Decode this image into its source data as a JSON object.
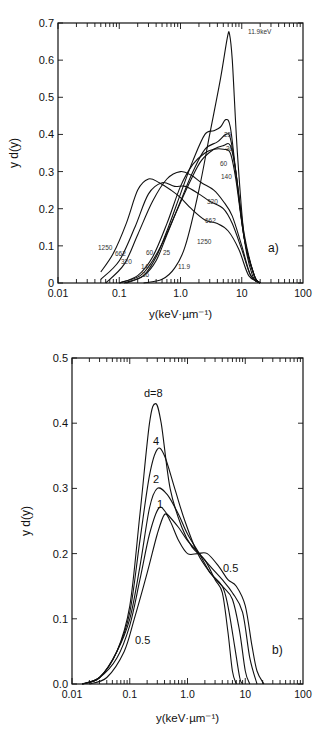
{
  "chart_data": [
    {
      "panel": "a)",
      "type": "line",
      "title": "",
      "xlabel": "y(keV·µm⁻¹)",
      "ylabel": "y d(y)",
      "xscale": "log",
      "xlim": [
        0.01,
        100
      ],
      "ylim": [
        0,
        0.7
      ],
      "xticks": [
        "0.01",
        "0.1",
        "1.0",
        "10",
        "100"
      ],
      "yticks": [
        "0",
        "0.1",
        "0.2",
        "0.3",
        "0.4",
        "0.5",
        "0.6",
        "0.7"
      ],
      "grid": false,
      "legend": "inline curve labels",
      "annotations": [
        "11.9keV",
        "25",
        "36",
        "60",
        "140",
        "320",
        "662",
        "1250",
        "11.9",
        "a)"
      ],
      "series": [
        {
          "name": "11.9 keV",
          "x": [
            0.25,
            0.5,
            0.8,
            1.2,
            2,
            3,
            4.5,
            5.8,
            6.3,
            7,
            8.5,
            11,
            15,
            20
          ],
          "y": [
            0.0,
            0.01,
            0.04,
            0.1,
            0.25,
            0.4,
            0.55,
            0.66,
            0.67,
            0.6,
            0.35,
            0.12,
            0.02,
            0.0
          ]
        },
        {
          "name": "25",
          "x": [
            0.13,
            0.25,
            0.4,
            0.6,
            1.0,
            1.6,
            2.5,
            3.5,
            4.5,
            5.5,
            6.5,
            8,
            11,
            16,
            20
          ],
          "y": [
            0.0,
            0.02,
            0.07,
            0.14,
            0.24,
            0.33,
            0.4,
            0.41,
            0.42,
            0.44,
            0.42,
            0.3,
            0.12,
            0.02,
            0.0
          ]
        },
        {
          "name": "36",
          "x": [
            0.12,
            0.25,
            0.4,
            0.6,
            1.0,
            1.6,
            2.5,
            4,
            5.5,
            6.5,
            8,
            11,
            16,
            20
          ],
          "y": [
            0.0,
            0.02,
            0.06,
            0.13,
            0.22,
            0.3,
            0.36,
            0.38,
            0.4,
            0.39,
            0.3,
            0.12,
            0.02,
            0.0
          ]
        },
        {
          "name": "60",
          "x": [
            0.1,
            0.22,
            0.35,
            0.55,
            0.9,
            1.5,
            2.2,
            3.5,
            5,
            6.5,
            8,
            11,
            16,
            20
          ],
          "y": [
            0.0,
            0.02,
            0.06,
            0.12,
            0.2,
            0.28,
            0.33,
            0.36,
            0.37,
            0.37,
            0.3,
            0.13,
            0.02,
            0.0
          ]
        },
        {
          "name": "140",
          "x": [
            0.1,
            0.2,
            0.35,
            0.6,
            1.0,
            1.6,
            2.5,
            3.5,
            5,
            6.5,
            8,
            11,
            16,
            20
          ],
          "y": [
            0.0,
            0.02,
            0.07,
            0.16,
            0.26,
            0.32,
            0.35,
            0.36,
            0.36,
            0.35,
            0.28,
            0.12,
            0.02,
            0.0
          ]
        },
        {
          "name": "320",
          "x": [
            0.06,
            0.12,
            0.2,
            0.35,
            0.6,
            1.0,
            1.5,
            2.2,
            3.5,
            5,
            7,
            10,
            14,
            20
          ],
          "y": [
            0.0,
            0.05,
            0.13,
            0.22,
            0.28,
            0.3,
            0.29,
            0.27,
            0.25,
            0.22,
            0.18,
            0.1,
            0.02,
            0.0
          ]
        },
        {
          "name": "662",
          "x": [
            0.05,
            0.1,
            0.18,
            0.3,
            0.5,
            0.8,
            1.2,
            2,
            3,
            5,
            7,
            10,
            14,
            20
          ],
          "y": [
            0.01,
            0.06,
            0.15,
            0.24,
            0.27,
            0.26,
            0.26,
            0.24,
            0.22,
            0.2,
            0.16,
            0.09,
            0.02,
            0.0
          ]
        },
        {
          "name": "1250",
          "x": [
            0.05,
            0.08,
            0.13,
            0.2,
            0.3,
            0.45,
            0.7,
            1.0,
            1.5,
            2.5,
            4,
            6,
            9,
            13,
            20
          ],
          "y": [
            0.03,
            0.08,
            0.16,
            0.25,
            0.28,
            0.27,
            0.25,
            0.23,
            0.2,
            0.17,
            0.16,
            0.14,
            0.09,
            0.02,
            0.0
          ]
        }
      ]
    },
    {
      "panel": "b)",
      "type": "line",
      "title": "",
      "xlabel": "y(keV·µm⁻¹)",
      "ylabel": "y d(y)",
      "xscale": "log",
      "xlim": [
        0.01,
        100
      ],
      "ylim": [
        0.0,
        0.5
      ],
      "xticks": [
        "0.01",
        "0.1",
        "1.0",
        "10",
        "100"
      ],
      "yticks": [
        "0.0",
        "0.1",
        "0.2",
        "0.3",
        "0.4",
        "0.5"
      ],
      "grid": false,
      "legend": "inline curve labels",
      "annotations": [
        "d=8",
        "4",
        "2",
        "1",
        "0.5",
        "0.5",
        "b)"
      ],
      "series": [
        {
          "name": "d=8",
          "x": [
            0.015,
            0.03,
            0.06,
            0.1,
            0.15,
            0.22,
            0.28,
            0.35,
            0.5,
            0.8,
            1.2,
            2,
            3,
            4,
            5,
            6,
            7
          ],
          "y": [
            0.0,
            0.01,
            0.05,
            0.12,
            0.26,
            0.4,
            0.43,
            0.4,
            0.3,
            0.24,
            0.21,
            0.19,
            0.16,
            0.14,
            0.08,
            0.02,
            0.0
          ]
        },
        {
          "name": "4",
          "x": [
            0.015,
            0.03,
            0.06,
            0.1,
            0.15,
            0.22,
            0.3,
            0.4,
            0.6,
            0.9,
            1.5,
            2.5,
            4,
            5,
            6.5,
            8,
            9
          ],
          "y": [
            0.0,
            0.01,
            0.05,
            0.11,
            0.22,
            0.32,
            0.36,
            0.35,
            0.3,
            0.25,
            0.2,
            0.17,
            0.15,
            0.12,
            0.06,
            0.01,
            0.0
          ]
        },
        {
          "name": "2",
          "x": [
            0.015,
            0.03,
            0.06,
            0.1,
            0.15,
            0.22,
            0.3,
            0.45,
            0.7,
            1.0,
            1.6,
            2.5,
            4,
            6,
            8,
            10,
            12
          ],
          "y": [
            0.0,
            0.01,
            0.05,
            0.1,
            0.18,
            0.27,
            0.3,
            0.29,
            0.26,
            0.23,
            0.2,
            0.17,
            0.15,
            0.13,
            0.08,
            0.02,
            0.0
          ]
        },
        {
          "name": "1",
          "x": [
            0.015,
            0.03,
            0.06,
            0.1,
            0.15,
            0.22,
            0.32,
            0.45,
            0.7,
            1.0,
            1.6,
            2.5,
            4,
            6,
            9,
            12,
            16
          ],
          "y": [
            0.0,
            0.01,
            0.04,
            0.09,
            0.16,
            0.23,
            0.27,
            0.26,
            0.24,
            0.22,
            0.2,
            0.18,
            0.16,
            0.14,
            0.11,
            0.04,
            0.0
          ]
        },
        {
          "name": "0.5",
          "x": [
            0.02,
            0.04,
            0.08,
            0.12,
            0.2,
            0.3,
            0.4,
            0.5,
            0.7,
            1.0,
            1.5,
            2.2,
            3.5,
            5,
            7,
            10,
            13,
            16,
            21
          ],
          "y": [
            0.0,
            0.01,
            0.05,
            0.1,
            0.17,
            0.23,
            0.26,
            0.25,
            0.22,
            0.2,
            0.2,
            0.2,
            0.18,
            0.16,
            0.15,
            0.12,
            0.06,
            0.02,
            0.0
          ]
        }
      ]
    }
  ],
  "labels": {
    "a": {
      "ylabel": "y d(y)",
      "xlabel": "y(keV·µm⁻¹)",
      "panel": "a)",
      "xticks": [
        "0.01",
        "0.1",
        "1.0",
        "10",
        "100"
      ],
      "yticks": [
        "0",
        "0.1",
        "0.2",
        "0.3",
        "0.4",
        "0.5",
        "0.6",
        "0.7"
      ]
    },
    "b": {
      "ylabel": "y d(y)",
      "xlabel": "y(keV·µm⁻¹)",
      "panel": "b)",
      "xticks": [
        "0.01",
        "0.1",
        "1.0",
        "10",
        "100"
      ],
      "yticks": [
        "0.0",
        "0.1",
        "0.2",
        "0.3",
        "0.4",
        "0.5"
      ]
    }
  },
  "curve_labels": {
    "a": [
      {
        "text": "11.9keV",
        "x": 248,
        "y": 34
      },
      {
        "text": "25",
        "x": 224,
        "y": 137
      },
      {
        "text": "36",
        "x": 226,
        "y": 151
      },
      {
        "text": "60",
        "x": 220,
        "y": 166
      },
      {
        "text": "140",
        "x": 221,
        "y": 179
      },
      {
        "text": "320",
        "x": 207,
        "y": 204
      },
      {
        "text": "662",
        "x": 205,
        "y": 223
      },
      {
        "text": "1250",
        "x": 197,
        "y": 244
      },
      {
        "text": "1250",
        "x": 98,
        "y": 250
      },
      {
        "text": "662",
        "x": 115,
        "y": 256
      },
      {
        "text": "320",
        "x": 121,
        "y": 264
      },
      {
        "text": "60",
        "x": 146,
        "y": 255
      },
      {
        "text": "25",
        "x": 163,
        "y": 255
      },
      {
        "text": "140",
        "x": 141,
        "y": 269
      },
      {
        "text": "36",
        "x": 142,
        "y": 277
      },
      {
        "text": "11.9",
        "x": 178,
        "y": 269
      }
    ],
    "b": [
      {
        "text": "d=8",
        "x": 144,
        "y": 397,
        "size": 11
      },
      {
        "text": "4",
        "x": 153,
        "y": 445,
        "size": 11
      },
      {
        "text": "2",
        "x": 153,
        "y": 483,
        "size": 11
      },
      {
        "text": "1",
        "x": 157,
        "y": 508,
        "size": 11
      },
      {
        "text": "0.5",
        "x": 223,
        "y": 572,
        "size": 11
      },
      {
        "text": "0.5",
        "x": 135,
        "y": 644,
        "size": 11
      }
    ]
  }
}
